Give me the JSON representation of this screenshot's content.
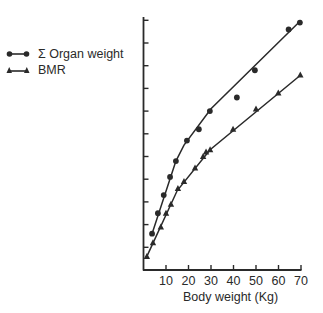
{
  "chart_data": {
    "type": "line",
    "title": "",
    "xlabel": "Body weight (Kg)",
    "ylabel": "",
    "xlim": [
      0,
      70
    ],
    "ylim": [
      0,
      11
    ],
    "x_ticks": [
      10,
      20,
      30,
      40,
      50,
      60,
      70
    ],
    "y_ticks_unlabeled": 11,
    "grid": false,
    "legend_position": "upper-left (outside plot)",
    "series": [
      {
        "name": "Σ Organ weight",
        "marker": "circle",
        "points": [
          [
            3.8,
            1.6
          ],
          [
            6.4,
            2.5
          ],
          [
            9,
            3.3
          ],
          [
            11.8,
            4.1
          ],
          [
            14.4,
            4.8
          ],
          [
            19.3,
            5.7
          ],
          [
            24.6,
            6.2
          ],
          [
            29.5,
            7.0
          ],
          [
            41.5,
            7.6
          ],
          [
            49.5,
            8.8
          ],
          [
            64.5,
            10.6
          ],
          [
            69.5,
            10.9
          ]
        ],
        "fit_line": [
          [
            3.8,
            1.6
          ],
          [
            14.4,
            4.8
          ],
          [
            18,
            5.5
          ],
          [
            30,
            7.1
          ],
          [
            70,
            11.0
          ]
        ]
      },
      {
        "name": "BMR",
        "marker": "triangle",
        "points": [
          [
            1.5,
            0.6
          ],
          [
            4.2,
            1.2
          ],
          [
            7.7,
            1.9
          ],
          [
            10,
            2.5
          ],
          [
            12.2,
            2.9
          ],
          [
            15.3,
            3.6
          ],
          [
            18,
            3.9
          ],
          [
            22.9,
            4.5
          ],
          [
            26.5,
            5.0
          ],
          [
            27.8,
            5.2
          ],
          [
            29.6,
            5.3
          ],
          [
            39.8,
            6.2
          ],
          [
            50,
            7.1
          ],
          [
            59.9,
            7.8
          ],
          [
            69.7,
            8.6
          ]
        ],
        "fit_line": [
          [
            1.5,
            0.6
          ],
          [
            15,
            3.5
          ],
          [
            29.6,
            5.3
          ],
          [
            70,
            8.6
          ]
        ]
      }
    ]
  },
  "legend": {
    "items": [
      {
        "label": "Σ Organ weight",
        "marker": "circle"
      },
      {
        "label": "BMR",
        "marker": "triangle"
      }
    ]
  },
  "axis": {
    "xlabel": "Body weight (Kg)",
    "x_tick_labels": [
      "10",
      "20",
      "30",
      "40",
      "50",
      "60",
      "70"
    ]
  }
}
